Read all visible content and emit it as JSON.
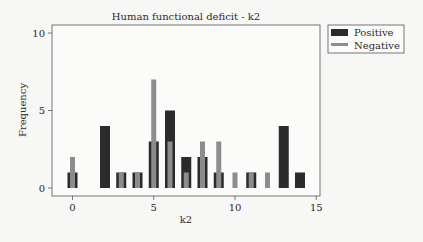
{
  "chart_data": {
    "type": "bar",
    "title": "Human functional deficit - k2",
    "xlabel": "k2",
    "ylabel": "Frequency",
    "xlim": [
      -1.2,
      15.3
    ],
    "ylim": [
      -0.5,
      10.5
    ],
    "xticks": [
      0,
      5,
      10,
      15
    ],
    "yticks": [
      0,
      5,
      10
    ],
    "grid": false,
    "legend_position": "outside-top-right",
    "x": [
      0,
      1,
      2,
      3,
      4,
      5,
      6,
      7,
      8,
      9,
      10,
      11,
      12,
      13,
      14
    ],
    "series": [
      {
        "name": "Positive",
        "color": "#2b2b2b",
        "values": [
          1,
          0,
          4,
          1,
          1,
          3,
          5,
          2,
          2,
          1,
          0,
          1,
          0,
          4,
          1
        ]
      },
      {
        "name": "Negative",
        "color": "#8c8c8c",
        "values": [
          2,
          0,
          0,
          1,
          1,
          7,
          3,
          1,
          3,
          3,
          1,
          1,
          1,
          0,
          0
        ]
      }
    ]
  }
}
